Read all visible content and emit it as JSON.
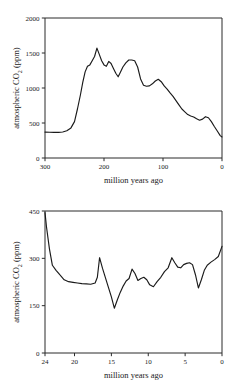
{
  "chart_data": [
    {
      "id": "phanerozoic-co2",
      "type": "line",
      "title": "",
      "xlabel": "million years ago",
      "ylabel": "atmospheric CO2 (ppm)",
      "ylabel_parts": {
        "pre": "atmospheric CO",
        "sub": "2",
        "post": " (ppm)"
      },
      "xlim": [
        300,
        0
      ],
      "ylim": [
        0,
        2000
      ],
      "x_reversed": true,
      "grid": false,
      "legend": "none",
      "xticks": [
        300,
        200,
        100,
        0
      ],
      "xticklabels": [
        "300",
        "200",
        "100",
        "0"
      ],
      "yticks": [
        0,
        500,
        1000,
        1500,
        2000
      ],
      "yticklabels": [
        "0",
        "500",
        "1000",
        "1500",
        "2000"
      ],
      "series": [
        {
          "name": "atmospheric CO2",
          "x": [
            300,
            292,
            285,
            277,
            270,
            263,
            256,
            250,
            245,
            240,
            236,
            232,
            228,
            224,
            220,
            216,
            212,
            208,
            204,
            200,
            196,
            192,
            188,
            184,
            180,
            176,
            172,
            168,
            163,
            158,
            153,
            148,
            143,
            138,
            133,
            128,
            123,
            118,
            113,
            108,
            103,
            98,
            93,
            88,
            83,
            78,
            73,
            68,
            63,
            58,
            53,
            48,
            43,
            38,
            33,
            28,
            23,
            18,
            13,
            8,
            3,
            0
          ],
          "y": [
            370,
            368,
            366,
            366,
            372,
            390,
            430,
            520,
            700,
            900,
            1080,
            1230,
            1310,
            1330,
            1390,
            1450,
            1570,
            1480,
            1390,
            1330,
            1310,
            1380,
            1350,
            1280,
            1210,
            1160,
            1230,
            1300,
            1360,
            1400,
            1400,
            1390,
            1300,
            1130,
            1040,
            1025,
            1030,
            1060,
            1100,
            1125,
            1090,
            1030,
            985,
            930,
            880,
            820,
            760,
            700,
            660,
            620,
            600,
            585,
            560,
            540,
            555,
            590,
            575,
            520,
            450,
            385,
            320,
            300
          ]
        }
      ]
    },
    {
      "id": "neogene-co2",
      "type": "line",
      "title": "",
      "xlabel": "million years ago",
      "ylabel": "atmospheric CO2 (ppm)",
      "ylabel_parts": {
        "pre": "atmospheric CO",
        "sub": "2",
        "post": " (ppm)"
      },
      "xlim": [
        24,
        0
      ],
      "ylim": [
        0,
        450
      ],
      "x_reversed": true,
      "grid": false,
      "legend": "none",
      "xticks": [
        24,
        20,
        15,
        10,
        5,
        0
      ],
      "xticklabels": [
        "24",
        "20",
        "15",
        "10",
        "5",
        "0"
      ],
      "yticks": [
        0,
        150,
        300,
        450
      ],
      "yticklabels": [
        "0",
        "150",
        "300",
        "450"
      ],
      "series": [
        {
          "name": "atmospheric CO2",
          "x": [
            24.0,
            23.8,
            23.4,
            23.0,
            22.5,
            22.0,
            21.4,
            20.8,
            20.2,
            19.6,
            19.0,
            18.4,
            17.8,
            17.2,
            16.9,
            16.6,
            16.2,
            15.8,
            15.4,
            15.0,
            14.6,
            14.2,
            13.8,
            13.4,
            13.0,
            12.6,
            12.2,
            11.8,
            11.4,
            11.0,
            10.6,
            10.2,
            9.8,
            9.3,
            8.8,
            8.3,
            7.8,
            7.3,
            6.8,
            6.4,
            6.0,
            5.6,
            5.2,
            4.8,
            4.4,
            4.0,
            3.6,
            3.2,
            2.8,
            2.4,
            2.0,
            1.5,
            1.0,
            0.5,
            0.0
          ],
          "y": [
            445,
            400,
            330,
            278,
            262,
            248,
            232,
            226,
            224,
            222,
            220,
            219,
            218,
            222,
            240,
            302,
            268,
            238,
            208,
            178,
            142,
            168,
            192,
            212,
            228,
            236,
            266,
            252,
            230,
            236,
            240,
            232,
            216,
            210,
            226,
            240,
            258,
            270,
            302,
            286,
            272,
            270,
            280,
            284,
            286,
            280,
            248,
            206,
            232,
            262,
            278,
            288,
            296,
            306,
            338
          ]
        }
      ]
    }
  ]
}
